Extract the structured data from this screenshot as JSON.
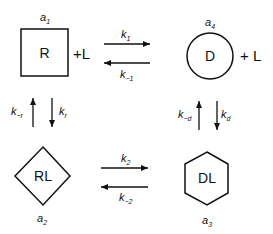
{
  "diagram": {
    "type": "kinetic-scheme",
    "nodes": [
      {
        "id": "R",
        "label": "R",
        "shape": "square",
        "state": "a",
        "state_sub": "1",
        "suffix": "+L"
      },
      {
        "id": "D",
        "label": "D",
        "shape": "circle",
        "state": "a",
        "state_sub": "4",
        "suffix": "+ L"
      },
      {
        "id": "RL",
        "label": "RL",
        "shape": "diamond",
        "state": "a",
        "state_sub": "2"
      },
      {
        "id": "DL",
        "label": "DL",
        "shape": "hexagon",
        "state": "a",
        "state_sub": "3"
      }
    ],
    "rates": {
      "k1": {
        "base": "k",
        "sub": "1"
      },
      "k_1": {
        "base": "k",
        "sub": "−1"
      },
      "kr": {
        "base": "k",
        "sub": "r"
      },
      "k_r": {
        "base": "k",
        "sub": "−r"
      },
      "k2": {
        "base": "k",
        "sub": "2"
      },
      "k_2": {
        "base": "k",
        "sub": "−2"
      },
      "kd": {
        "base": "k",
        "sub": "d"
      },
      "k_d": {
        "base": "k",
        "sub": "−d"
      }
    },
    "edges": [
      {
        "from": "R",
        "to": "D",
        "forward": "k1",
        "reverse": "k_1"
      },
      {
        "from": "R",
        "to": "RL",
        "forward": "kr",
        "reverse": "k_r"
      },
      {
        "from": "RL",
        "to": "DL",
        "forward": "k2",
        "reverse": "k_2"
      },
      {
        "from": "D",
        "to": "DL",
        "forward": "kd",
        "reverse": "k_d"
      }
    ]
  }
}
